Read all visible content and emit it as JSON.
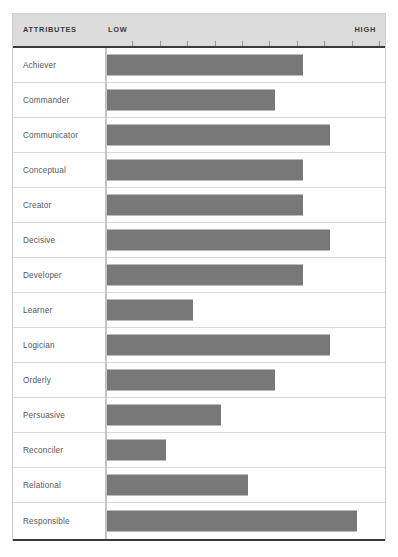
{
  "header": {
    "attributes_label": "ATTRIBUTES",
    "low_label": "LOW",
    "high_label": "HIGH"
  },
  "colors": {
    "bar": "#787878",
    "header_band": "#dcdcdc",
    "rule": "#3a3a3a",
    "grid": "#d9d9d9",
    "axis": "#c4c4c4",
    "label_text": "#58585a",
    "header_text": "#3b3b3b",
    "frame_border": "#cfcfcf"
  },
  "chart_data": {
    "type": "bar",
    "orientation": "horizontal",
    "title": "",
    "xlabel": "",
    "ylabel": "ATTRIBUTES",
    "xlim": [
      0,
      100
    ],
    "grid": true,
    "legend": "none",
    "axis_tick_labels": [
      "LOW",
      "HIGH"
    ],
    "tick_count": 10,
    "categories": [
      "Achiever",
      "Commander",
      "Communicator",
      "Conceptual",
      "Creator",
      "Decisive",
      "Developer",
      "Learner",
      "Logician",
      "Orderly",
      "Persuasive",
      "Reconciler",
      "Relational",
      "Responsible"
    ],
    "values": [
      72,
      62,
      82,
      72,
      72,
      82,
      72,
      32,
      82,
      62,
      42,
      22,
      52,
      92
    ]
  }
}
